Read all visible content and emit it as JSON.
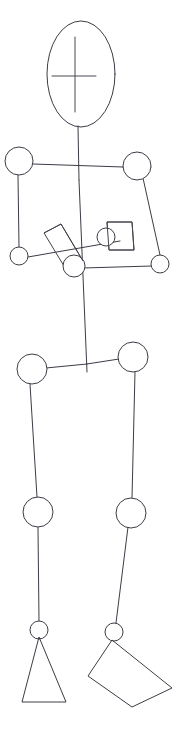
{
  "canvas": {
    "width": 187,
    "height": 744,
    "background": "#ffffff",
    "stroke_color": "#3c3c46",
    "stroke_width": 1,
    "title": "Stick Figure Pose Sketch"
  },
  "figure": {
    "name": "stick-figure",
    "head": {
      "label": "head-ellipse",
      "cx": 81,
      "cy": 74,
      "rx": 34,
      "ry": 53,
      "face": {
        "vertical_line": {
          "x1": 75,
          "y1": 37,
          "x2": 75,
          "y2": 112
        },
        "horizontal_line": {
          "x1": 52,
          "y1": 76,
          "x2": 96,
          "y2": 76
        }
      }
    },
    "joints": [
      {
        "name": "neck-base",
        "cx": 77,
        "cy": 127,
        "r": 0
      },
      {
        "name": "shoulder-left",
        "cx": 19,
        "cy": 161,
        "r": 14
      },
      {
        "name": "shoulder-right",
        "cx": 137,
        "cy": 166,
        "r": 14
      },
      {
        "name": "elbow-left",
        "cx": 19,
        "cy": 256,
        "r": 9
      },
      {
        "name": "elbow-right",
        "cx": 160,
        "cy": 264,
        "r": 9
      },
      {
        "name": "hand-left",
        "cx": 74,
        "cy": 266,
        "r": 11
      },
      {
        "name": "hand-right",
        "cx": 106,
        "cy": 237,
        "r": 9
      },
      {
        "name": "hip-left",
        "cx": 32,
        "cy": 369,
        "r": 15
      },
      {
        "name": "hip-right",
        "cx": 133,
        "cy": 357,
        "r": 15
      },
      {
        "name": "knee-left",
        "cx": 38,
        "cy": 512,
        "r": 15
      },
      {
        "name": "knee-right",
        "cx": 131,
        "cy": 513,
        "r": 15
      },
      {
        "name": "ankle-left",
        "cx": 39,
        "cy": 630,
        "r": 9
      },
      {
        "name": "ankle-right",
        "cx": 114,
        "cy": 632,
        "r": 9
      }
    ],
    "bones": [
      {
        "name": "neck",
        "x1": 78,
        "y1": 126,
        "x2": 79,
        "y2": 180
      },
      {
        "name": "spine",
        "x1": 79,
        "y1": 180,
        "x2": 87,
        "y2": 372
      },
      {
        "name": "clavicle-left",
        "x1": 33,
        "y1": 164,
        "x2": 123,
        "y2": 167
      },
      {
        "name": "clavicle-right",
        "x1": 123,
        "y1": 167,
        "x2": 151,
        "y2": 167
      },
      {
        "name": "upper-arm-left",
        "x1": 18,
        "y1": 175,
        "x2": 19,
        "y2": 247
      },
      {
        "name": "upper-arm-right",
        "x1": 143,
        "y1": 178,
        "x2": 160,
        "y2": 255
      },
      {
        "name": "forearm-left",
        "x1": 28,
        "y1": 257,
        "x2": 120,
        "y2": 241
      },
      {
        "name": "forearm-right",
        "x1": 83,
        "y1": 268,
        "x2": 152,
        "y2": 266
      },
      {
        "name": "pelvis-left",
        "x1": 46,
        "y1": 368,
        "x2": 87,
        "y2": 364
      },
      {
        "name": "pelvis-right",
        "x1": 87,
        "y1": 364,
        "x2": 119,
        "y2": 359
      },
      {
        "name": "thigh-left",
        "x1": 30,
        "y1": 384,
        "x2": 37,
        "y2": 497
      },
      {
        "name": "thigh-right",
        "x1": 135,
        "y1": 372,
        "x2": 132,
        "y2": 498
      },
      {
        "name": "shin-left",
        "x1": 38,
        "y1": 527,
        "x2": 39,
        "y2": 621
      },
      {
        "name": "shin-right",
        "x1": 128,
        "y1": 527,
        "x2": 116,
        "y2": 623
      }
    ],
    "props": [
      {
        "name": "held-object-left",
        "shape": "rotated-rectangle",
        "points": "44,233 61,224 83,261 67,271"
      },
      {
        "name": "held-object-right",
        "shape": "rectangle",
        "points": "107,222 132,222 134,250 109,250"
      }
    ],
    "feet": [
      {
        "name": "foot-left",
        "shape": "triangle",
        "points": "39,637 22,702 66,702"
      },
      {
        "name": "foot-right",
        "shape": "quadrilateral",
        "points": "112,640 88,676 132,707 172,688"
      }
    ]
  },
  "labels": {
    "head": "head",
    "torso": "torso",
    "left_arm": "left arm",
    "right_arm": "right arm",
    "left_leg": "left leg",
    "right_leg": "right leg",
    "left_prop": "left held object",
    "right_prop": "right held object"
  }
}
